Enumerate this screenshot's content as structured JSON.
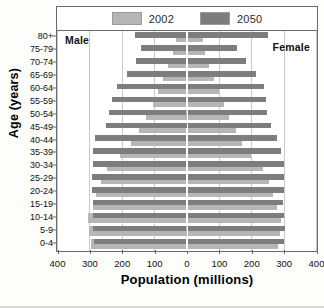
{
  "chart_data": {
    "type": "bar",
    "chart_subtype": "population-pyramid",
    "title": "",
    "xlabel": "Population (millions)",
    "ylabel": "Age (years)",
    "xlim": [
      -400,
      400
    ],
    "xticks": [
      -400,
      -300,
      -200,
      -100,
      0,
      100,
      200,
      300,
      400
    ],
    "xtick_labels": [
      "400",
      "300",
      "200",
      "100",
      "0",
      "100",
      "200",
      "300",
      "400"
    ],
    "grid": true,
    "legend_position": "top",
    "side_labels": {
      "left": "Male",
      "right": "Female"
    },
    "categories": [
      "80+",
      "75-79",
      "70-74",
      "65-69",
      "60-64",
      "55-59",
      "50-54",
      "45-49",
      "40-44",
      "35-39",
      "30-34",
      "25-29",
      "20-24",
      "15-19",
      "10-14",
      "5-9",
      "0-4"
    ],
    "series": [
      {
        "name": "2002",
        "color": "#b6b6b6",
        "male": [
          32,
          42,
          56,
          72,
          88,
          105,
          125,
          146,
          170,
          205,
          245,
          265,
          280,
          290,
          305,
          300,
          295
        ],
        "female": [
          50,
          57,
          70,
          86,
          100,
          115,
          132,
          152,
          172,
          200,
          235,
          255,
          268,
          278,
          292,
          288,
          282
        ]
      },
      {
        "name": "2050",
        "color": "#7d7d7d",
        "male": [
          158,
          142,
          155,
          185,
          215,
          230,
          240,
          250,
          282,
          288,
          290,
          292,
          293,
          290,
          290,
          288,
          287
        ],
        "female": [
          252,
          155,
          185,
          215,
          240,
          245,
          250,
          262,
          280,
          292,
          300,
          302,
          300,
          297,
          300,
          305,
          300
        ]
      }
    ],
    "legend": [
      {
        "label": "2002",
        "color": "#b6b6b6"
      },
      {
        "label": "2050",
        "color": "#7d7d7d"
      }
    ]
  }
}
